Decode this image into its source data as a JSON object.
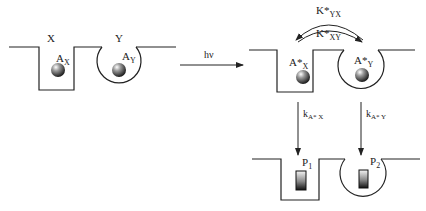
{
  "diagram": {
    "left_panel": {
      "site_x_label": "X",
      "site_y_label": "Y",
      "particle_x_label": "A",
      "particle_x_sub": "X",
      "particle_y_label": "A",
      "particle_y_sub": "Y"
    },
    "excitation": {
      "label": "hν"
    },
    "right_top_panel": {
      "particle_x_label": "A*",
      "particle_x_sub": "X",
      "particle_y_label": "A*",
      "particle_y_sub": "Y",
      "rate_yx_label": "K*",
      "rate_yx_sub": "YX",
      "rate_xy_label": "K*",
      "rate_xy_sub": "XY"
    },
    "decay": {
      "rate_x_label": "k",
      "rate_x_sub": "A* X",
      "rate_y_label": "k",
      "rate_y_sub": "A* Y"
    },
    "right_bottom_panel": {
      "product_1_label": "P",
      "product_1_sub": "1",
      "product_2_label": "P",
      "product_2_sub": "2"
    }
  }
}
